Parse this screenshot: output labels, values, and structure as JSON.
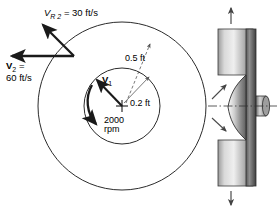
{
  "figure": {
    "labels": {
      "relative_velocity_symbol": "V",
      "relative_velocity_sub": "R 2",
      "relative_velocity_eq": "= 30 ft/s",
      "absolute_velocity_symbol": "V",
      "absolute_velocity_sub": "2",
      "absolute_velocity_eq": "=",
      "absolute_velocity_value": "60 ft/s",
      "inner_velocity_symbol": "V",
      "inner_velocity_sub": "1",
      "outer_radius": "0.5 ft",
      "inner_radius": "0.2 ft",
      "speed_value": "2000",
      "speed_unit": "rpm"
    },
    "geometry": {
      "center_x": 122,
      "center_y": 106,
      "outer_radius_px": 84,
      "inner_radius_px": 38
    },
    "colors": {
      "line": "#2b2b2b",
      "metal_light": "#e8e8e8",
      "metal_mid": "#a8a8a8",
      "metal_dark": "#4a4a4a",
      "arrow": "#1a1a1a"
    },
    "icons": {
      "outer_circle": "circle-icon",
      "inner_circle": "circle-icon",
      "center_mark": "cross-icon",
      "rotation_arc": "curved-arrow-icon",
      "top_arrow": "arrow-up-icon",
      "bottom_arrow": "arrow-down-icon",
      "flow_arrow_upper": "arrow-up-right-icon",
      "flow_arrow_lower": "arrow-down-right-icon",
      "centerline": "dash-dot-line-icon"
    }
  }
}
